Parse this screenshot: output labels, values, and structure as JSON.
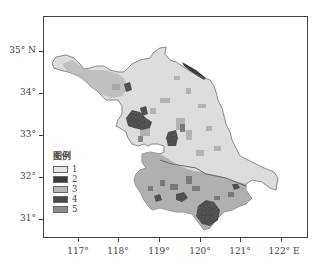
{
  "map": {
    "region": "Jiangsu Province land-use classification",
    "y_axis": {
      "ticks": [
        {
          "label": "35° N",
          "y": 51
        },
        {
          "label": "34°",
          "y": 93
        },
        {
          "label": "33°",
          "y": 135
        },
        {
          "label": "32°",
          "y": 177
        },
        {
          "label": "31°",
          "y": 219
        }
      ]
    },
    "x_axis": {
      "ticks": [
        {
          "label": "117°",
          "x": 78
        },
        {
          "label": "118°",
          "x": 118
        },
        {
          "label": "119°",
          "x": 159
        },
        {
          "label": "120°",
          "x": 200
        },
        {
          "label": "121°",
          "x": 240
        },
        {
          "label": "122° E",
          "x": 281
        }
      ]
    },
    "legend": {
      "title": "图例",
      "items": [
        {
          "label": "1",
          "color": "#e4e4e4"
        },
        {
          "label": "2",
          "color": "#3c3c3c"
        },
        {
          "label": "3",
          "color": "#b8b8b8"
        },
        {
          "label": "4",
          "color": "#4a4a4a"
        },
        {
          "label": "5",
          "color": "#8e8e8e"
        }
      ]
    }
  }
}
